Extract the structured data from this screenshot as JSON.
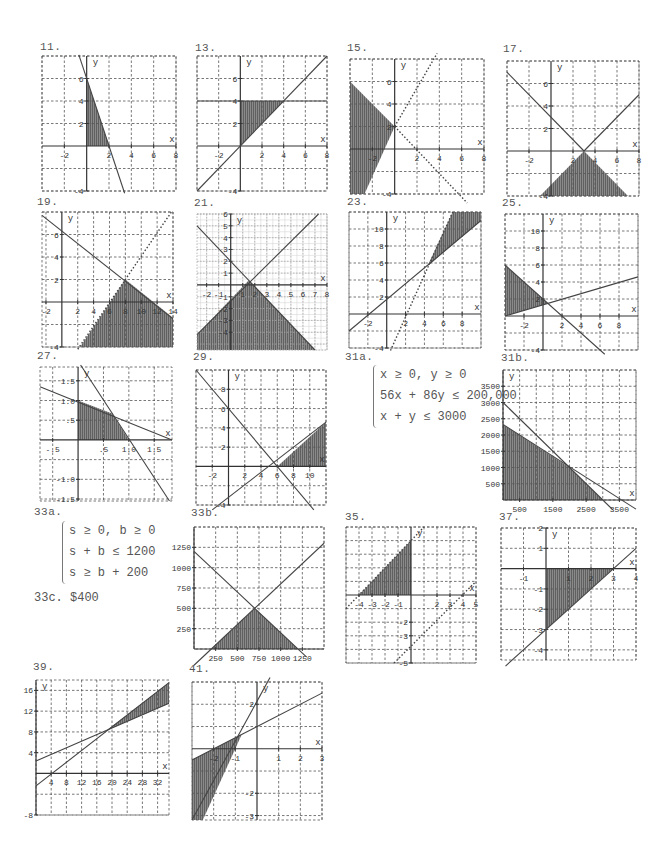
{
  "page": {
    "problems": [
      {
        "id": "11",
        "label": "11."
      },
      {
        "id": "13",
        "label": "13."
      },
      {
        "id": "15",
        "label": "15."
      },
      {
        "id": "17",
        "label": "17."
      },
      {
        "id": "19",
        "label": "19."
      },
      {
        "id": "21",
        "label": "21."
      },
      {
        "id": "23",
        "label": "23."
      },
      {
        "id": "25",
        "label": "25."
      },
      {
        "id": "27",
        "label": "27."
      },
      {
        "id": "29",
        "label": "29."
      },
      {
        "id": "31a",
        "label": "31a."
      },
      {
        "id": "31b",
        "label": "31b."
      },
      {
        "id": "33a",
        "label": "33a."
      },
      {
        "id": "33b",
        "label": "33b."
      },
      {
        "id": "33c",
        "label": "33c."
      },
      {
        "id": "35",
        "label": "35."
      },
      {
        "id": "37",
        "label": "37."
      },
      {
        "id": "39",
        "label": "39."
      },
      {
        "id": "41",
        "label": "41."
      }
    ],
    "system_31a": [
      "x ≥ 0, y ≥ 0",
      "56x + 86y ≤ 200,000",
      "x + y ≤ 3000"
    ],
    "system_33a": [
      "s ≥ 0, b ≥ 0",
      "s + b ≤ 1200",
      "s ≥ b + 200"
    ],
    "answer_33c": "$400"
  },
  "chart_data": [
    {
      "id": "11",
      "type": "region",
      "box": [
        42,
        56,
        134,
        135
      ],
      "xlim": [
        -4,
        8
      ],
      "ylim": [
        -4,
        8
      ],
      "grid": 2,
      "xticks": [
        -2,
        2,
        4,
        6,
        8
      ],
      "yticks": [
        -4,
        2,
        4,
        6
      ],
      "lines": [
        {
          "p1": [
            -0.7,
            8.1
          ],
          "p2": [
            3.4,
            -4.2
          ],
          "style": "solid"
        }
      ],
      "shade": [
        [
          0,
          0
        ],
        [
          0,
          6
        ],
        [
          2,
          0
        ]
      ],
      "xlabel": "x",
      "ylabel": "y"
    },
    {
      "id": "13",
      "type": "region",
      "box": [
        197,
        56,
        130,
        135
      ],
      "xlim": [
        -4,
        8
      ],
      "ylim": [
        -4,
        8
      ],
      "grid": 2,
      "xticks": [
        -2,
        2,
        4,
        6,
        8
      ],
      "yticks": [
        -4,
        2,
        4,
        6
      ],
      "lines": [
        {
          "p1": [
            -4,
            -4
          ],
          "p2": [
            8,
            8
          ],
          "style": "solid"
        },
        {
          "p1": [
            -4,
            4
          ],
          "p2": [
            8,
            4
          ],
          "style": "solid"
        }
      ],
      "shade": [
        [
          0,
          0
        ],
        [
          0,
          4
        ],
        [
          4,
          4
        ]
      ],
      "xlabel": "x",
      "ylabel": "y"
    },
    {
      "id": "15",
      "type": "region",
      "box": [
        350,
        59,
        134,
        135
      ],
      "xlim": [
        -4,
        8
      ],
      "ylim": [
        -4,
        8
      ],
      "grid": 2,
      "xticks": [
        -2,
        2,
        4,
        6,
        8
      ],
      "yticks": [
        -4,
        2,
        4,
        6
      ],
      "lines": [
        {
          "p1": [
            0,
            2
          ],
          "p2": [
            3.8,
            8.5
          ],
          "style": "dotted"
        },
        {
          "p1": [
            0,
            2
          ],
          "p2": [
            6.5,
            -4.8
          ],
          "style": "dotted"
        }
      ],
      "shade": [
        [
          -4,
          6
        ],
        [
          0,
          2
        ],
        [
          -2.7,
          -4
        ],
        [
          -4,
          -4
        ]
      ],
      "xlabel": "x",
      "ylabel": "y"
    },
    {
      "id": "17",
      "type": "region",
      "box": [
        507,
        61,
        132,
        135
      ],
      "xlim": [
        -4,
        8
      ],
      "ylim": [
        -4,
        8
      ],
      "grid": 2,
      "xticks": [
        -2,
        2,
        4,
        6,
        8
      ],
      "yticks": [
        -4,
        2,
        4,
        6
      ],
      "lines": [
        {
          "p1": [
            -4,
            7
          ],
          "p2": [
            3,
            0
          ],
          "style": "solid"
        },
        {
          "p1": [
            3,
            0
          ],
          "p2": [
            8,
            5
          ],
          "style": "solid"
        }
      ],
      "shade": [
        [
          -1.3,
          -4.3
        ],
        [
          3,
          0
        ],
        [
          7.3,
          -4.3
        ]
      ],
      "xlabel": "x",
      "ylabel": "y"
    },
    {
      "id": "19",
      "type": "region",
      "box": [
        42,
        212,
        131,
        135
      ],
      "xlim": [
        -2.5,
        14
      ],
      "ylim": [
        -4,
        8
      ],
      "grid": 2,
      "xticks": [
        -2,
        2,
        4,
        6,
        8,
        10,
        12,
        14
      ],
      "yticks": [
        -4,
        2,
        4,
        6
      ],
      "lines": [
        {
          "p1": [
            -2.5,
            7.7
          ],
          "p2": [
            14,
            -1.5
          ],
          "style": "solid"
        },
        {
          "p1": [
            2,
            -4.2
          ],
          "p2": [
            13.8,
            8
          ],
          "style": "dotted"
        }
      ],
      "shade": [
        [
          2.1,
          -4.2
        ],
        [
          8,
          2
        ],
        [
          14,
          -1.4
        ],
        [
          14,
          -4.2
        ]
      ],
      "xlabel": "x",
      "ylabel": "y"
    },
    {
      "id": "21",
      "type": "region",
      "box": [
        197,
        214,
        130,
        136
      ],
      "xlim": [
        -2.8,
        8
      ],
      "ylim": [
        -5.5,
        6
      ],
      "grid": 1,
      "fine": true,
      "xticks": [
        -2,
        -1,
        1,
        2,
        3,
        4,
        5,
        6,
        7,
        8
      ],
      "yticks": [
        -4,
        -3,
        -2,
        -1,
        1,
        2,
        3,
        4,
        5,
        6
      ],
      "lines": [
        {
          "p1": [
            -2.8,
            5
          ],
          "p2": [
            7,
            -5.5
          ],
          "style": "solid"
        },
        {
          "p1": [
            -2.8,
            -4.2
          ],
          "p2": [
            7.3,
            6
          ],
          "style": "solid"
        }
      ],
      "shade": [
        [
          -2.8,
          -5.5
        ],
        [
          -2.8,
          -4.2
        ],
        [
          1.5,
          0.4
        ],
        [
          7,
          -5.5
        ]
      ],
      "xlabel": "x",
      "ylabel": "y"
    },
    {
      "id": "23",
      "type": "region",
      "box": [
        349,
        212,
        132,
        136
      ],
      "xlim": [
        -4,
        10
      ],
      "ylim": [
        -4,
        12
      ],
      "grid": 2,
      "xticks": [
        -2,
        2,
        4,
        6,
        8
      ],
      "yticks": [
        -4,
        2,
        4,
        6,
        8,
        10
      ],
      "lines": [
        {
          "p1": [
            -4,
            -2
          ],
          "p2": [
            10,
            11
          ],
          "style": "solid"
        },
        {
          "p1": [
            0.4,
            -4.3
          ],
          "p2": [
            7,
            12
          ],
          "style": "dotted"
        }
      ],
      "shade": [
        [
          4.3,
          5.6
        ],
        [
          7,
          12
        ],
        [
          10,
          12
        ],
        [
          10,
          11
        ]
      ],
      "xlabel": "x",
      "ylabel": "y"
    },
    {
      "id": "25",
      "type": "region",
      "box": [
        505,
        214,
        133,
        136
      ],
      "xlim": [
        -4,
        10
      ],
      "ylim": [
        -4,
        12
      ],
      "grid": 2,
      "xticks": [
        -2,
        2,
        4,
        6,
        8
      ],
      "yticks": [
        -4,
        2,
        4,
        6,
        8,
        10
      ],
      "lines": [
        {
          "p1": [
            -4,
            0
          ],
          "p2": [
            10,
            4.6
          ],
          "style": "solid"
        },
        {
          "p1": [
            -4,
            6
          ],
          "p2": [
            6.5,
            -4.5
          ],
          "style": "solid"
        }
      ],
      "shade": [
        [
          -4,
          0
        ],
        [
          -4,
          6
        ],
        [
          0.5,
          1.5
        ]
      ],
      "xlabel": "x",
      "ylabel": "y"
    },
    {
      "id": "27",
      "type": "region",
      "box": [
        40,
        367,
        132,
        134
      ],
      "xlim": [
        -0.75,
        1.85
      ],
      "ylim": [
        -1.55,
        1.85
      ],
      "grid": 0.5,
      "xticks": [
        -0.5,
        0.5,
        1.0,
        1.5
      ],
      "yticks": [
        -1.5,
        -1.0,
        0.5,
        1.0,
        1.5
      ],
      "tickfmt": "dec",
      "lines": [
        {
          "p1": [
            -0.75,
            1.35
          ],
          "p2": [
            1.85,
            0
          ],
          "style": "solid"
        },
        {
          "p1": [
            0.05,
            1.9
          ],
          "p2": [
            1.8,
            -1.55
          ],
          "style": "solid"
        }
      ],
      "shade": [
        [
          0,
          0
        ],
        [
          0,
          1
        ],
        [
          0.67,
          0.67
        ],
        [
          1,
          0
        ]
      ],
      "xlabel": "x",
      "ylabel": "y"
    },
    {
      "id": "29",
      "type": "region",
      "box": [
        196,
        370,
        130,
        135
      ],
      "xlim": [
        -4,
        12
      ],
      "ylim": [
        -4,
        10
      ],
      "grid": 2,
      "xticks": [
        -2,
        2,
        4,
        6,
        8,
        10
      ],
      "yticks": [
        -4,
        2,
        4,
        6,
        8
      ],
      "lines": [
        {
          "p1": [
            -4,
            10
          ],
          "p2": [
            10.5,
            -4.5
          ],
          "style": "solid"
        },
        {
          "p1": [
            -2,
            -4.5
          ],
          "p2": [
            12,
            4.6
          ],
          "style": "solid"
        }
      ],
      "shade": [
        [
          6,
          0
        ],
        [
          12,
          4.6
        ],
        [
          12,
          0
        ]
      ],
      "xlabel": "x",
      "ylabel": "y"
    },
    {
      "id": "31b",
      "type": "region",
      "box": [
        503,
        370,
        133,
        130
      ],
      "xlim": [
        0,
        4000
      ],
      "ylim": [
        0,
        4000
      ],
      "grid": 500,
      "xticks": [
        500,
        1500,
        2500,
        3500
      ],
      "yticks": [
        500,
        1000,
        1500,
        2000,
        2500,
        3000,
        3500
      ],
      "xtickshow": [
        500,
        1500,
        2500,
        3500
      ],
      "lines": [
        {
          "p1": [
            0,
            3000
          ],
          "p2": [
            3300,
            -300
          ],
          "style": "solid"
        },
        {
          "p1": [
            0,
            2326
          ],
          "p2": [
            4000,
            -280
          ],
          "style": "solid"
        }
      ],
      "shade": [
        [
          0,
          0
        ],
        [
          0,
          2326
        ],
        [
          2000,
          1000
        ],
        [
          3000,
          0
        ]
      ],
      "xlabel": "x",
      "ylabel": "y"
    },
    {
      "id": "33b",
      "type": "region",
      "box": [
        194,
        527,
        130,
        122
      ],
      "xlim": [
        0,
        1500
      ],
      "ylim": [
        0,
        1500
      ],
      "grid": 250,
      "xticks": [
        250,
        500,
        750,
        1000,
        1250
      ],
      "yticks": [
        250,
        500,
        750,
        1000,
        1250
      ],
      "lines": [
        {
          "p1": [
            0,
            1200
          ],
          "p2": [
            1300,
            -100
          ],
          "style": "solid"
        },
        {
          "p1": [
            0,
            -200
          ],
          "p2": [
            1500,
            1300
          ],
          "style": "solid"
        }
      ],
      "shade": [
        [
          200,
          0
        ],
        [
          700,
          500
        ],
        [
          1200,
          0
        ]
      ],
      "xlabel": "",
      "ylabel": ""
    },
    {
      "id": "35",
      "type": "region",
      "box": [
        346,
        527,
        130,
        136
      ],
      "xlim": [
        -5,
        5
      ],
      "ylim": [
        -5,
        5
      ],
      "grid": 1,
      "xticks": [
        -4,
        -3,
        -2,
        -1,
        2,
        3,
        4,
        5
      ],
      "yticks": [
        -5,
        -3,
        -2
      ],
      "lines": [
        {
          "p1": [
            -5,
            -1
          ],
          "p2": [
            1,
            5
          ],
          "style": "dotted"
        },
        {
          "p1": [
            -1.3,
            -5
          ],
          "p2": [
            5,
            1
          ],
          "style": "dotted"
        }
      ],
      "shade": [
        [
          -4,
          0
        ],
        [
          0,
          4
        ],
        [
          0,
          0
        ]
      ],
      "xlabel": "x",
      "ylabel": "y"
    },
    {
      "id": "37",
      "type": "region",
      "box": [
        501,
        528,
        135,
        132
      ],
      "xlim": [
        -2,
        4
      ],
      "ylim": [
        -4.5,
        2
      ],
      "grid": 1,
      "xticks": [
        -1,
        1,
        2,
        3,
        4
      ],
      "yticks": [
        -4,
        -3,
        -2,
        -1,
        1,
        2
      ],
      "lines": [
        {
          "p1": [
            -1.8,
            -4.8
          ],
          "p2": [
            4,
            1
          ],
          "style": "solid"
        }
      ],
      "shade": [
        [
          0,
          0
        ],
        [
          0,
          -3
        ],
        [
          3,
          0
        ]
      ],
      "xlabel": "x",
      "ylabel": "y"
    },
    {
      "id": "39",
      "type": "region",
      "box": [
        36,
        680,
        133,
        135
      ],
      "xlim": [
        0,
        35
      ],
      "ylim": [
        -8,
        18
      ],
      "grid": 4,
      "xticks": [
        4,
        8,
        12,
        16,
        20,
        24,
        28,
        32
      ],
      "yticks": [
        -8,
        4,
        8,
        12,
        16
      ],
      "lines": [
        {
          "p1": [
            0,
            2.4
          ],
          "p2": [
            35,
            13.5
          ],
          "style": "solid"
        },
        {
          "p1": [
            0,
            -2.4
          ],
          "p2": [
            35,
            17.5
          ],
          "style": "solid"
        }
      ],
      "shade": [
        [
          18.5,
          8.3
        ],
        [
          35,
          17.5
        ],
        [
          35,
          13.5
        ]
      ],
      "xlabel": "x",
      "ylabel": "y"
    },
    {
      "id": "41",
      "type": "region",
      "box": [
        192,
        682,
        130,
        138
      ],
      "xlim": [
        -3,
        3
      ],
      "ylim": [
        -3.2,
        3
      ],
      "grid": 1,
      "xticks": [
        -2,
        -1,
        1,
        2,
        3
      ],
      "yticks": [
        -3,
        -2,
        2
      ],
      "lines": [
        {
          "p1": [
            -3,
            -0.5
          ],
          "p2": [
            3,
            2.5
          ],
          "style": "solid"
        },
        {
          "p1": [
            -3,
            -3.2
          ],
          "p2": [
            0.6,
            3.2
          ],
          "style": "solid"
        }
      ],
      "shade": [
        [
          -3,
          -0.5
        ],
        [
          -0.7,
          0.65
        ],
        [
          -1,
          0
        ],
        [
          -2.5,
          -3.2
        ],
        [
          -3,
          -3.2
        ]
      ],
      "xlabel": "x",
      "ylabel": "y"
    }
  ]
}
